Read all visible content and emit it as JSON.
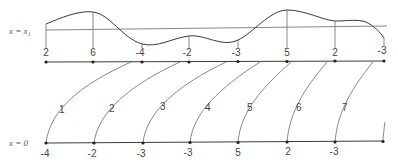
{
  "diagram": {
    "top_axis": {
      "label": "x = x₁",
      "y": 62,
      "points": [
        {
          "x": 46,
          "value": "2"
        },
        {
          "x": 93,
          "value": "6"
        },
        {
          "x": 142,
          "value": "-4"
        },
        {
          "x": 189,
          "value": "-2"
        },
        {
          "x": 238,
          "value": "-3"
        },
        {
          "x": 287,
          "value": "5"
        },
        {
          "x": 335,
          "value": "2"
        },
        {
          "x": 384,
          "value": "-3"
        }
      ],
      "reference_line_y": 30
    },
    "bottom_axis": {
      "label": "x = 0",
      "y": 143,
      "points": [
        {
          "x": 46,
          "value": "-4"
        },
        {
          "x": 94,
          "value": "-2"
        },
        {
          "x": 143,
          "value": "-3"
        },
        {
          "x": 190,
          "value": "-3"
        },
        {
          "x": 238,
          "value": "5"
        },
        {
          "x": 287,
          "value": "2"
        },
        {
          "x": 335,
          "value": "-3"
        },
        {
          "x": 383,
          "value": ""
        }
      ]
    },
    "characteristics": [
      {
        "label": "1",
        "from_x": 46,
        "to_x": 131,
        "label_x": 61,
        "label_y": 113
      },
      {
        "label": "2",
        "from_x": 94,
        "to_x": 180,
        "label_x": 111,
        "label_y": 112
      },
      {
        "label": "3",
        "from_x": 143,
        "to_x": 226,
        "label_x": 162,
        "label_y": 110
      },
      {
        "label": "4",
        "from_x": 190,
        "to_x": 260,
        "label_x": 205,
        "label_y": 110
      },
      {
        "label": "5",
        "from_x": 238,
        "to_x": 291,
        "label_x": 249,
        "label_y": 110
      },
      {
        "label": "6",
        "from_x": 287,
        "to_x": 327,
        "label_x": 297,
        "label_y": 110
      },
      {
        "label": "7",
        "from_x": 335,
        "to_x": 373,
        "label_x": 343,
        "label_y": 110
      }
    ]
  }
}
